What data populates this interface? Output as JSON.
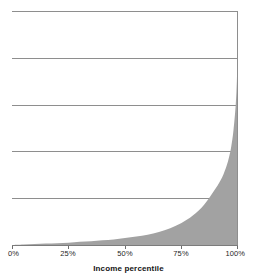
{
  "chart_data": {
    "type": "area",
    "title": "",
    "subtitle": "",
    "xlabel": "Income percentile",
    "ylabel": "",
    "xlim": [
      0,
      100
    ],
    "ylim": [
      0,
      5
    ],
    "grid": true,
    "gridlines_y": [
      5,
      4,
      3,
      2,
      1
    ],
    "legend": null,
    "legend_position": "none",
    "fill_color": "#a2a2a2",
    "gridline_color": "#8e8e8e",
    "axis_color": "#7c7c7c",
    "xticks": [
      0,
      25,
      50,
      75,
      100
    ],
    "xtick_labels": [
      "0%",
      "25%",
      "50%",
      "75%",
      "100%"
    ],
    "yticks": [],
    "ytick_labels": [],
    "series": [
      {
        "name": "Income share",
        "x": [
          0,
          5,
          10,
          15,
          20,
          25,
          30,
          35,
          40,
          45,
          50,
          55,
          60,
          65,
          70,
          75,
          80,
          85,
          90,
          93,
          95,
          96,
          97,
          98,
          99,
          99.5,
          99.8,
          100
        ],
        "y": [
          0.0,
          0.01,
          0.02,
          0.03,
          0.04,
          0.05,
          0.07,
          0.08,
          0.1,
          0.12,
          0.15,
          0.18,
          0.22,
          0.28,
          0.36,
          0.47,
          0.63,
          0.86,
          1.2,
          1.45,
          1.7,
          1.87,
          2.1,
          2.45,
          3.0,
          3.5,
          3.95,
          4.15
        ]
      }
    ]
  },
  "axis": {
    "x_title": "Income percentile"
  },
  "icons": {
    "none": ""
  }
}
